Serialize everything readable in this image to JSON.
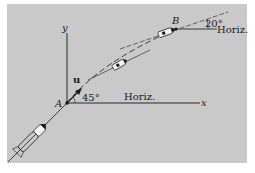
{
  "diagram": {
    "type": "rocket trajectory",
    "colors": {
      "background": "#c9c9c9",
      "ink": "#1a1a1a",
      "rocket_body": "#f2f2f2"
    },
    "axes": {
      "x_label": "x",
      "y_label": "y"
    },
    "points": {
      "A": "A",
      "B": "B"
    },
    "vector_label": "u",
    "angle_at_A": "45°",
    "angle_at_B": "20°",
    "horiz_label_A": "Horiz.",
    "horiz_label_B": "Horiz."
  }
}
